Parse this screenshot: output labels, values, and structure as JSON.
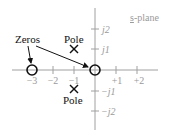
{
  "diagram": {
    "plane_label_prefix": "s",
    "plane_label_suffix": "-plane",
    "x_ticks": [
      {
        "value": -3,
        "label": "−3"
      },
      {
        "value": -2,
        "label": "−2"
      },
      {
        "value": -1,
        "label": "−1"
      },
      {
        "value": 1,
        "label": "+1"
      },
      {
        "value": 2,
        "label": "+2"
      }
    ],
    "y_ticks": [
      {
        "value": 2,
        "label": "j2"
      },
      {
        "value": 1,
        "label": "j1"
      },
      {
        "value": -1,
        "label": "−j1"
      },
      {
        "value": -2,
        "label": "−j2"
      }
    ],
    "zeros_label": "Zeros",
    "pole_label_top": "Pole",
    "pole_label_bottom": "Pole",
    "zeros": [
      {
        "re": -3,
        "im": 0
      },
      {
        "re": 0,
        "im": 0
      }
    ],
    "poles": [
      {
        "re": -1,
        "im": 1
      },
      {
        "re": -1,
        "im": -1
      }
    ],
    "colors": {
      "axis": "#a0a0a0",
      "ink": "#111111",
      "tick_label": "#9a9a9a"
    }
  }
}
